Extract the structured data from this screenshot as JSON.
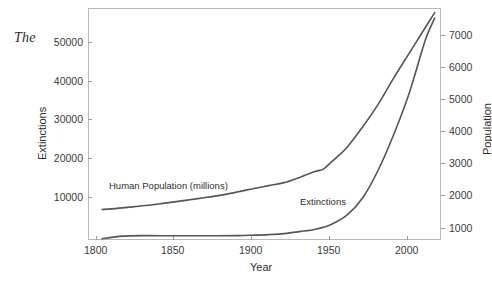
{
  "document": {
    "text_fragment": "The"
  },
  "figure": {
    "series_labels": {
      "population": "Human Population (millions)",
      "extinctions": "Extinctions"
    }
  },
  "chart_data": {
    "type": "line",
    "title": "",
    "xlabel": "Year",
    "ylabel": "Extinctions",
    "y2label": "Population",
    "grid": false,
    "legend": "inline-annotations",
    "xlim": [
      1795,
      2020
    ],
    "ylim": [
      0,
      58000
    ],
    "y2lim": [
      0,
      7600
    ],
    "xticks": [
      "1800",
      "1850",
      "1900",
      "1950",
      "2000"
    ],
    "xtick_values": [
      1800,
      1850,
      1900,
      1950,
      2000
    ],
    "yticks": [
      "10000",
      "20000",
      "30000",
      "40000",
      "50000"
    ],
    "ytick_values": [
      10000,
      20000,
      30000,
      40000,
      50000
    ],
    "y2ticks": [
      "1000",
      "2000",
      "3000",
      "4000",
      "5000",
      "6000",
      "7000"
    ],
    "y2tick_values": [
      1000,
      2000,
      3000,
      4000,
      5000,
      6000,
      7000
    ],
    "line_color": "#555555",
    "series": [
      {
        "name": "Human Population (millions)",
        "axis": "right",
        "unit": "millions",
        "x": [
          1804,
          1810,
          1820,
          1830,
          1840,
          1850,
          1860,
          1870,
          1880,
          1890,
          1900,
          1910,
          1920,
          1930,
          1940,
          1945,
          1950,
          1955,
          1960,
          1970,
          1980,
          1990,
          2000,
          2010,
          2016
        ],
        "values": [
          1000,
          1020,
          1070,
          1120,
          1180,
          1250,
          1320,
          1390,
          1470,
          1570,
          1680,
          1780,
          1880,
          2050,
          2250,
          2320,
          2550,
          2780,
          3030,
          3700,
          4450,
          5320,
          6140,
          6960,
          7450
        ]
      },
      {
        "name": "Extinctions",
        "axis": "left",
        "unit": "cumulative count",
        "x": [
          1804,
          1815,
          1830,
          1850,
          1870,
          1890,
          1900,
          1910,
          1920,
          1930,
          1940,
          1950,
          1960,
          1970,
          1980,
          1990,
          2000,
          2010,
          2016
        ],
        "values": [
          300,
          900,
          1100,
          1050,
          1050,
          1100,
          1200,
          1350,
          1600,
          2100,
          2700,
          3900,
          6200,
          10500,
          17500,
          26500,
          37000,
          50000,
          55500
        ]
      }
    ],
    "annotations": [
      {
        "text": "Human Population (millions)",
        "x": 1815,
        "y_axis": "right"
      },
      {
        "text": "Extinctions",
        "x": 1930,
        "y_axis": "left"
      }
    ]
  }
}
